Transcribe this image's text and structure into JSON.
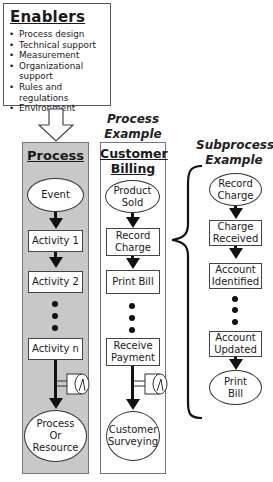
{
  "enablers": {
    "title": "Enablers",
    "items": [
      "Process design",
      "Technical support",
      "Measurement",
      "Organizational",
      "support",
      "Rules and regulations",
      "Environment"
    ]
  },
  "process_column": {
    "title": "Process",
    "event": "Event",
    "activity1": "Activity 1",
    "activity2": "Activity 2",
    "activityn": "Activity n",
    "end_line1": "Process",
    "end_line2": "Or",
    "end_line3": "Resource"
  },
  "process_example": {
    "label_line1": "Process",
    "label_line2": "Example",
    "title_line1": "Customer",
    "title_line2": "Billing",
    "start_line1": "Product",
    "start_line2": "Sold",
    "step1_line1": "Record",
    "step1_line2": "Charge",
    "step2": "Print Bill",
    "step3_line1": "Receive",
    "step3_line2": "Payment",
    "end_line1": "Customer",
    "end_line2": "Surveying"
  },
  "subprocess_example": {
    "label_line1": "Subprocess",
    "label_line2": "Example",
    "start_line1": "Record",
    "start_line2": "Charge",
    "step1_line1": "Charge",
    "step1_line2": "Received",
    "step2_line1": "Account",
    "step2_line2": "Identified",
    "step3_line1": "Account",
    "step3_line2": "Updated",
    "end_line1": "Print",
    "end_line2": "Bill"
  }
}
